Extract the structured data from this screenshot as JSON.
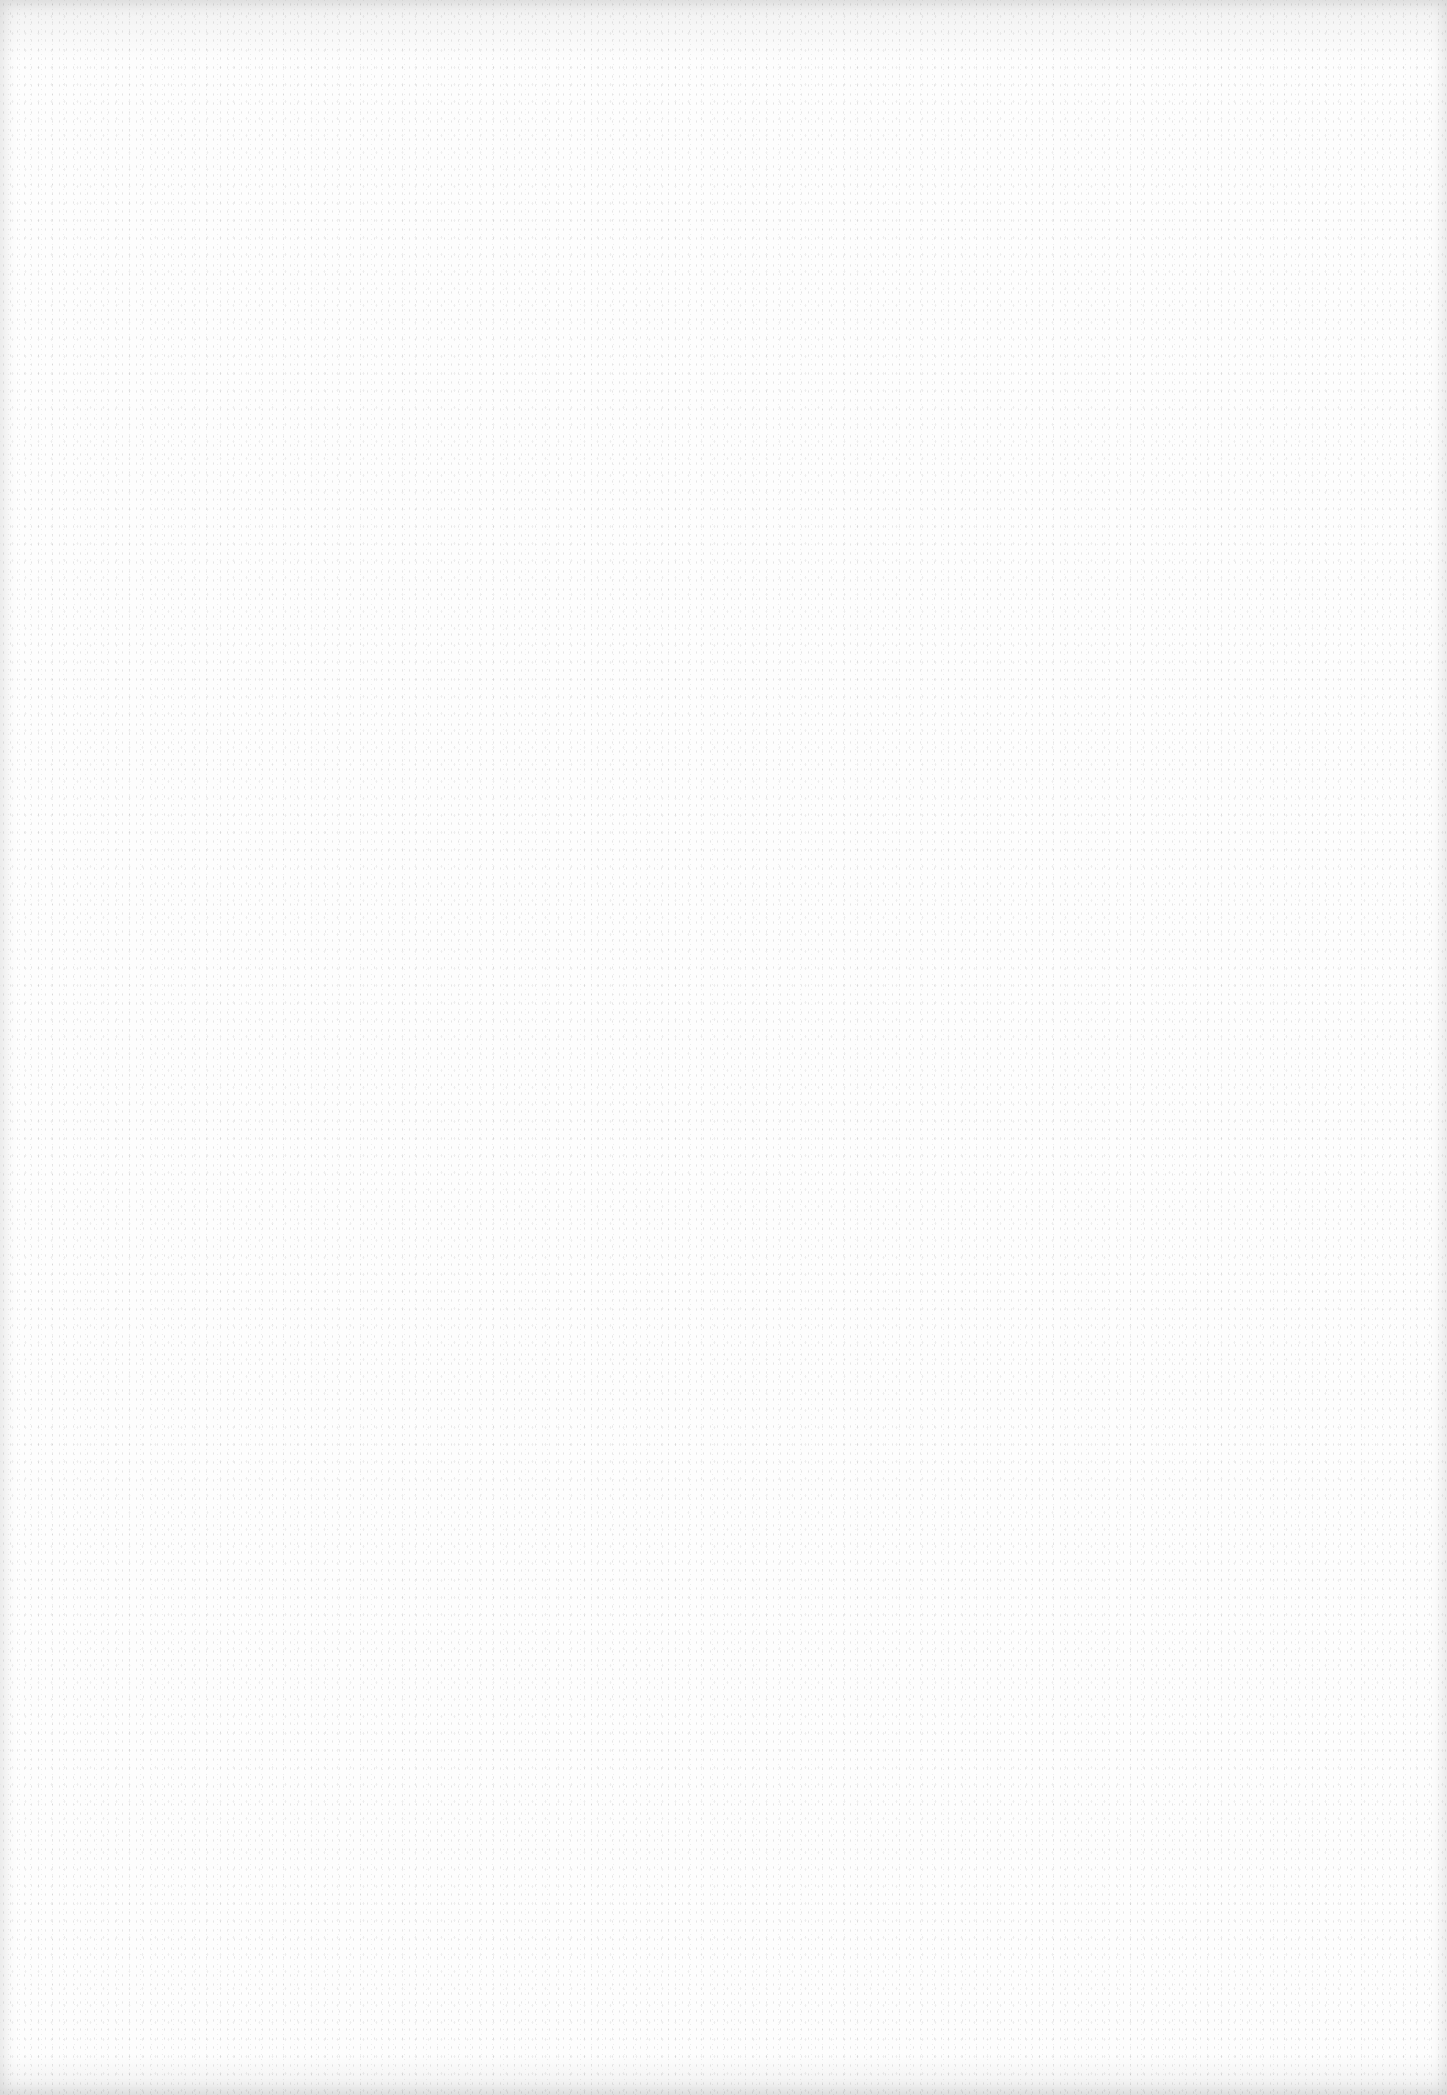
{
  "page": {
    "kind": "blank-scanned-sheet",
    "background_color": "#fdfdfd",
    "text_content": []
  }
}
